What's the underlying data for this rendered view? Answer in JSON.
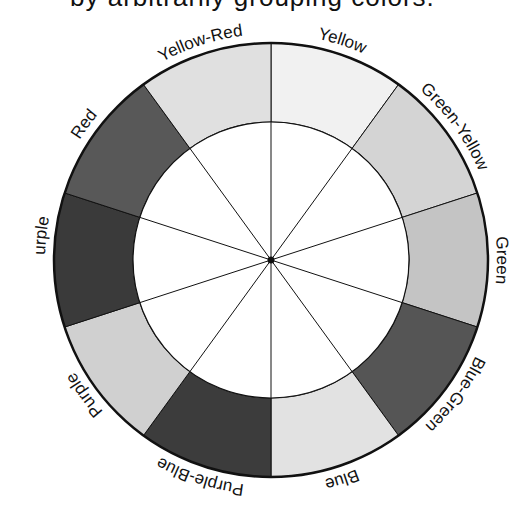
{
  "caption": {
    "text": "by arbitrarily grouping colors.",
    "note": "partially cropped at top edge"
  },
  "wheel": {
    "title": "Color wheel",
    "segment_count": 10,
    "segments": [
      {
        "label": "Yellow",
        "center_deg": 72,
        "shade": "#f1f1f1",
        "tone": "very light"
      },
      {
        "label": "Green-Yellow",
        "center_deg": 36,
        "shade": "#d4d4d4",
        "tone": "light"
      },
      {
        "label": "Green",
        "center_deg": 0,
        "shade": "#c4c4c4",
        "tone": "light-medium"
      },
      {
        "label": "Blue-Green",
        "center_deg": -36,
        "shade": "#555555",
        "tone": "dark"
      },
      {
        "label": "Blue",
        "center_deg": -72,
        "shade": "#e2e2e2",
        "tone": "light"
      },
      {
        "label": "Purple-Blue",
        "center_deg": -108,
        "shade": "#3c3c3c",
        "tone": "dark"
      },
      {
        "label": "Purple",
        "center_deg": -144,
        "shade": "#d0d0d0",
        "tone": "light"
      },
      {
        "label": "Red-Purple",
        "center_deg": 180,
        "shade": "#3a3a3a",
        "tone": "dark"
      },
      {
        "label": "Red",
        "center_deg": 144,
        "shade": "#585858",
        "tone": "dark"
      },
      {
        "label": "Yellow-Red",
        "center_deg": 108,
        "shade": "#e0e0e0",
        "tone": "light"
      }
    ],
    "line_color": "#111111",
    "inner_fill": "#ffffff"
  }
}
